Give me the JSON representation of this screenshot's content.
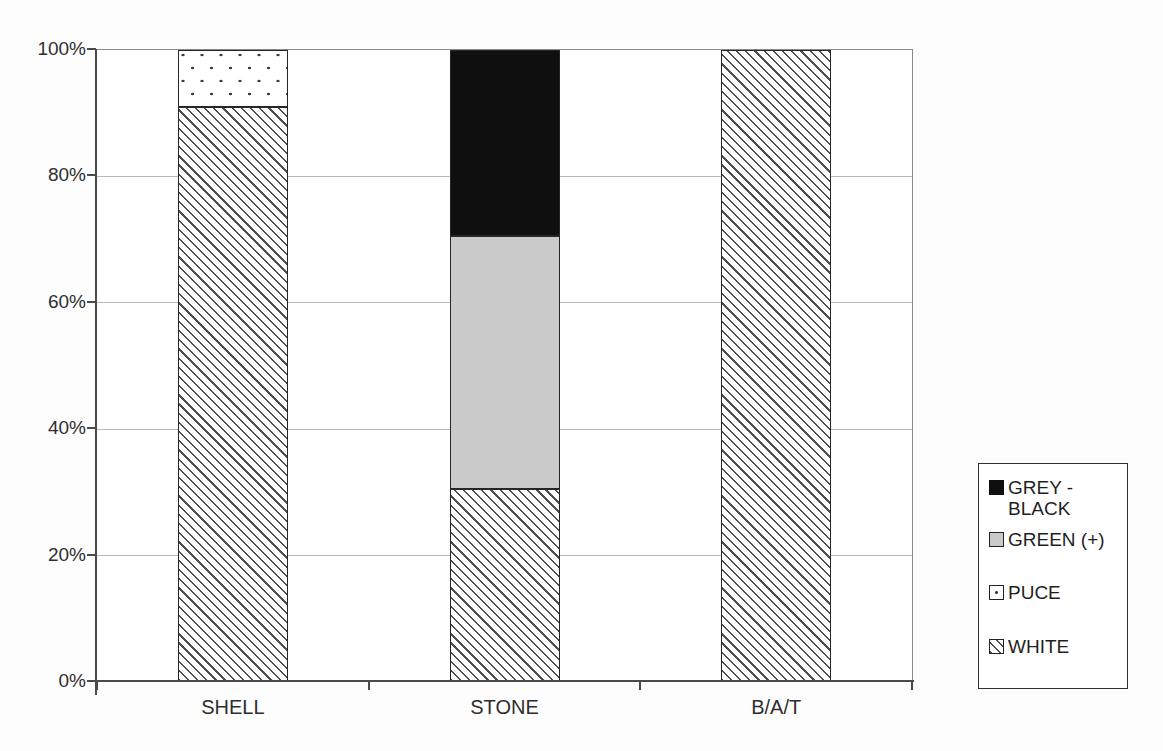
{
  "chart_data": {
    "type": "bar",
    "subtype": "stacked-100-percent",
    "title": "",
    "xlabel": "",
    "ylabel": "",
    "categories": [
      "SHELL",
      "STONE",
      "B/A/T"
    ],
    "series": [
      {
        "name": "GREY - BLACK",
        "pattern": "black",
        "values": [
          0,
          29.5,
          0
        ]
      },
      {
        "name": "GREEN (+)",
        "pattern": "grey",
        "values": [
          0,
          40,
          0
        ]
      },
      {
        "name": "PUCE",
        "pattern": "dots",
        "values": [
          9,
          0,
          0
        ]
      },
      {
        "name": "WHITE",
        "pattern": "hatch",
        "values": [
          91,
          30.5,
          100
        ]
      }
    ],
    "ylim": [
      0,
      100
    ],
    "y_tick_labels": [
      "0%",
      "20%",
      "40%",
      "60%",
      "80%",
      "100%"
    ],
    "y_tick_step_percent": 20,
    "grid": "horizontal",
    "legend_position": "right"
  },
  "legend": {
    "items": [
      {
        "label": "GREY - BLACK",
        "pattern": "black"
      },
      {
        "label": "GREEN (+)",
        "pattern": "grey"
      },
      {
        "label": "PUCE",
        "pattern": "dots"
      },
      {
        "label": "WHITE",
        "pattern": "hatch"
      }
    ]
  },
  "colors": {
    "background": "#fdfdfd",
    "plot_background": "#ffffff",
    "gridline": "#b9b9b9",
    "axis_line": "#4a4a4a",
    "plot_border": "#8a8a8a",
    "bar_border": "#262626",
    "text": "#2e2e2e",
    "green_plus_fill": "#cacaca",
    "grey_black_fill": "#0f0f0f"
  }
}
